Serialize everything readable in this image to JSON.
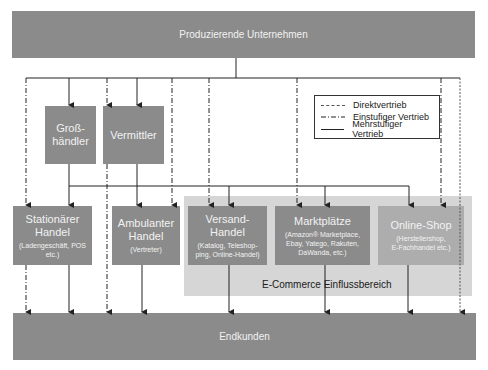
{
  "diagram": {
    "top_node": "Produzierende Unternehmen",
    "bottom_node": "Endkunden",
    "intermediaries": [
      {
        "title": "Groß-",
        "title2": "händler"
      },
      {
        "title": "Vermittler"
      }
    ],
    "retail": [
      {
        "title": "Stationärer",
        "title2": "Handel",
        "sub": "(Ladengeschäft, POS",
        "sub2": "etc.)"
      },
      {
        "title": "Ambulanter",
        "title2": "Handel",
        "sub": "(Vertreter)"
      },
      {
        "title": "Versand-",
        "title2": "Handel",
        "sub": "(Katalog, Teleshop-",
        "sub2": "ping, Online-Handel)"
      },
      {
        "title": "Marktplätze",
        "sub": "(Amazon® Marketplace,",
        "sub2": "Ebay, Yatego, Rakuten,",
        "sub3": "DaWanda, etc.)"
      },
      {
        "title": "Online-Shop",
        "sub": "(Herstellershop,",
        "sub2": "E-Fachhandel etc.)"
      }
    ],
    "zone_label": "E-Commerce Einflussbereich",
    "legend": [
      {
        "label": "Direktvertrieb",
        "style": "dashed"
      },
      {
        "label": "Einstufiger Vertrieb",
        "style": "dash-dot"
      },
      {
        "label": "Mehrstufiger Vertrieb",
        "style": "solid"
      }
    ],
    "colors": {
      "node": "#8b8b8b",
      "node_light": "#adadad",
      "zone": "#d6d6d6",
      "line": "#222222"
    }
  }
}
